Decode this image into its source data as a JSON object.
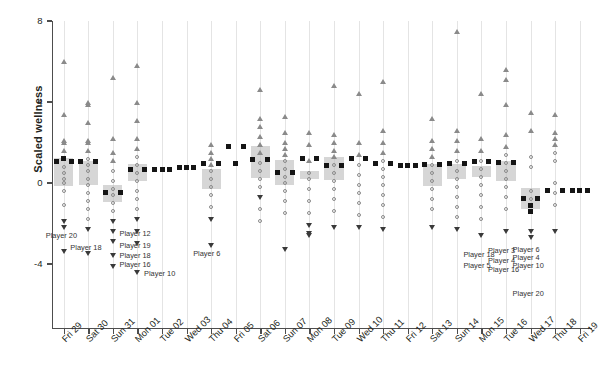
{
  "chart_data": {
    "type": "bar",
    "title": "",
    "xlabel": "",
    "ylabel": "Scaled wellness",
    "ylim": [
      -6.2,
      8
    ],
    "yticks": [
      8,
      4,
      0,
      -4
    ],
    "ytick_labels": [
      "8",
      "4",
      "0",
      "-4"
    ],
    "grid": "vertical-only",
    "legend": "none",
    "categories": [
      "Fri 29",
      "Sat 30",
      "Sun 31",
      "Mon 01",
      "Tue 02",
      "Wed 03",
      "Thu 04",
      "Fri 05",
      "Sat 06",
      "Sun 07",
      "Mon 08",
      "Tue 09",
      "Wed 10",
      "Thu 11",
      "Fri 12",
      "Sat 13",
      "Sun 14",
      "Mon 15",
      "Tue 16",
      "Wed 17",
      "Thu 18",
      "Fri 19"
    ],
    "series": [
      {
        "name": "Team mean scaled wellness",
        "marker": "filled-square",
        "values": [
          1.05,
          1.05,
          -0.45,
          0.65,
          0.65,
          0.75,
          0.95,
          1.8,
          1.15,
          0.5,
          1.2,
          0.85,
          1.2,
          0.95,
          0.85,
          0.9,
          0.95,
          1.05,
          1.0,
          -0.75,
          -0.35,
          -0.35
        ]
      }
    ],
    "boxes": [
      {
        "category": "Fri 29",
        "low": -0.15,
        "high": 1.25
      },
      {
        "category": "Sat 30",
        "low": -0.1,
        "high": 1.1
      },
      {
        "category": "Sun 31",
        "low": -0.95,
        "high": -0.1
      },
      {
        "category": "Mon 01",
        "low": 0.1,
        "high": 0.95
      },
      {
        "category": "Tue 02",
        "low": 0.0,
        "high": 0.0
      },
      {
        "category": "Wed 03",
        "low": 0.0,
        "high": 0.0
      },
      {
        "category": "Thu 04",
        "low": -0.3,
        "high": 0.7
      },
      {
        "category": "Fri 05",
        "low": 0.0,
        "high": 0.0
      },
      {
        "category": "Sat 06",
        "low": 0.25,
        "high": 1.85
      },
      {
        "category": "Sun 07",
        "low": -0.1,
        "high": 1.15
      },
      {
        "category": "Mon 08",
        "low": 0.2,
        "high": 0.6
      },
      {
        "category": "Tue 09",
        "low": 0.15,
        "high": 1.3
      },
      {
        "category": "Wed 10",
        "low": 0.0,
        "high": 0.0
      },
      {
        "category": "Thu 11",
        "low": 0.0,
        "high": 0.0
      },
      {
        "category": "Fri 12",
        "low": 0.0,
        "high": 0.0
      },
      {
        "category": "Sat 13",
        "low": -0.15,
        "high": 0.95
      },
      {
        "category": "Sun 14",
        "low": 0.2,
        "high": 0.95
      },
      {
        "category": "Mon 15",
        "low": 0.3,
        "high": 0.85
      },
      {
        "category": "Tue 16",
        "low": 0.1,
        "high": 1.1
      },
      {
        "category": "Wed 17",
        "low": -1.3,
        "high": -0.25
      },
      {
        "category": "Thu 18",
        "low": 0.0,
        "high": 0.0
      },
      {
        "category": "Fri 19",
        "low": 0.0,
        "high": 0.0
      }
    ],
    "points": [
      {
        "category": "Fri 29",
        "values": [
          6.0,
          3.4,
          2.1,
          2.0,
          1.6,
          1.2,
          0.8,
          0.5,
          0.2,
          0.0,
          -0.4,
          -1.1,
          -1.9,
          -2.2,
          -3.4
        ],
        "markers": [
          "up",
          "up",
          "up",
          "up",
          "up",
          "sq",
          "circle",
          "circle",
          "circle",
          "circle",
          "circle",
          "circle",
          "down",
          "down",
          "down"
        ]
      },
      {
        "category": "Sat 30",
        "values": [
          4.0,
          3.9,
          3.0,
          2.1,
          2.0,
          1.6,
          1.2,
          0.9,
          0.6,
          0.2,
          -0.1,
          -0.5,
          -0.9,
          -1.3,
          -1.8,
          -2.3,
          -3.5
        ],
        "markers": [
          "up",
          "up",
          "up",
          "up",
          "up",
          "up",
          "circle",
          "circle",
          "circle",
          "circle",
          "circle",
          "circle",
          "circle",
          "circle",
          "circle",
          "down",
          "down"
        ]
      },
      {
        "category": "Sun 31",
        "values": [
          5.2,
          2.2,
          1.5,
          1.1,
          0.6,
          0.1,
          -0.3,
          -0.6,
          -1.0,
          -1.4,
          -1.9,
          -2.4,
          -2.9,
          -3.6,
          -4.1
        ],
        "markers": [
          "up",
          "up",
          "up",
          "up",
          "circle",
          "circle",
          "circle",
          "circle",
          "circle",
          "circle",
          "down",
          "down",
          "down",
          "down",
          "down"
        ]
      },
      {
        "category": "Mon 01",
        "values": [
          5.8,
          4.0,
          3.1,
          2.2,
          1.7,
          1.3,
          0.9,
          0.5,
          0.1,
          -0.4,
          -0.8,
          -1.3,
          -1.8,
          -2.4,
          -3.0,
          -4.4
        ],
        "markers": [
          "up",
          "up",
          "up",
          "up",
          "up",
          "circle",
          "circle",
          "circle",
          "circle",
          "circle",
          "circle",
          "circle",
          "down",
          "down",
          "down",
          "down"
        ]
      },
      {
        "category": "Tue 02",
        "values": [
          0.65
        ],
        "markers": [
          "sq"
        ]
      },
      {
        "category": "Wed 03",
        "values": [
          0.75
        ],
        "markers": [
          "sq"
        ]
      },
      {
        "category": "Thu 04",
        "values": [
          1.9,
          1.5,
          1.2,
          0.9,
          0.6,
          0.2,
          -0.2,
          -0.6,
          -1.2,
          -1.8,
          -3.1
        ],
        "markers": [
          "up",
          "up",
          "up",
          "up",
          "circle",
          "circle",
          "circle",
          "circle",
          "circle",
          "down",
          "down"
        ]
      },
      {
        "category": "Fri 05",
        "values": [
          0.95
        ],
        "markers": [
          "sq"
        ]
      },
      {
        "category": "Sat 06",
        "values": [
          4.6,
          3.2,
          2.8,
          2.3,
          1.9,
          1.5,
          1.0,
          0.6,
          0.2,
          -0.2,
          -0.7,
          -1.3,
          -1.9
        ],
        "markers": [
          "up",
          "up",
          "up",
          "up",
          "up",
          "up",
          "circle",
          "circle",
          "circle",
          "circle",
          "down",
          "circle",
          "circle"
        ]
      },
      {
        "category": "Sun 07",
        "values": [
          3.3,
          2.5,
          2.0,
          1.7,
          1.4,
          1.1,
          0.7,
          0.3,
          0.0,
          -0.4,
          -0.9,
          -1.5,
          -3.3
        ],
        "markers": [
          "up",
          "up",
          "up",
          "up",
          "up",
          "circle",
          "circle",
          "circle",
          "circle",
          "circle",
          "circle",
          "circle",
          "down"
        ]
      },
      {
        "category": "Mon 08",
        "values": [
          2.5,
          1.9,
          1.1,
          0.5,
          0.2,
          -0.3,
          -0.9,
          -1.5,
          -2.1,
          -2.5,
          -2.6
        ],
        "markers": [
          "up",
          "up",
          "up",
          "circle",
          "circle",
          "circle",
          "circle",
          "circle",
          "down",
          "down",
          "down"
        ]
      },
      {
        "category": "Tue 09",
        "values": [
          4.8,
          2.4,
          2.0,
          1.6,
          1.3,
          0.9,
          0.5,
          0.1,
          -0.3,
          -0.8,
          -1.4,
          -2.2
        ],
        "markers": [
          "up",
          "up",
          "up",
          "up",
          "up",
          "circle",
          "circle",
          "circle",
          "circle",
          "circle",
          "circle",
          "down"
        ]
      },
      {
        "category": "Wed 10",
        "values": [
          4.4,
          2.0,
          1.4,
          0.9,
          0.4,
          -0.1,
          -0.5,
          -1.0,
          -1.6,
          -2.2
        ],
        "markers": [
          "up",
          "up",
          "up",
          "circle",
          "circle",
          "circle",
          "circle",
          "circle",
          "circle",
          "down"
        ]
      },
      {
        "category": "Thu 11",
        "values": [
          5.0,
          2.6,
          2.0,
          1.5,
          1.1,
          0.7,
          0.3,
          -0.1,
          -0.6,
          -1.1,
          -1.7,
          -2.3
        ],
        "markers": [
          "up",
          "up",
          "up",
          "up",
          "circle",
          "circle",
          "circle",
          "circle",
          "circle",
          "circle",
          "circle",
          "down"
        ]
      },
      {
        "category": "Fri 12",
        "values": [
          0.85
        ],
        "markers": [
          "sq"
        ]
      },
      {
        "category": "Sat 13",
        "values": [
          3.2,
          2.1,
          1.7,
          1.3,
          0.9,
          0.5,
          0.1,
          -0.3,
          -0.8,
          -1.3,
          -2.2
        ],
        "markers": [
          "up",
          "up",
          "up",
          "up",
          "circle",
          "circle",
          "circle",
          "circle",
          "circle",
          "circle",
          "down"
        ]
      },
      {
        "category": "Sun 14",
        "values": [
          7.5,
          2.6,
          2.1,
          1.6,
          1.1,
          0.6,
          0.2,
          -0.2,
          -0.7,
          -1.2,
          -1.7,
          -2.3
        ],
        "markers": [
          "up",
          "up",
          "up",
          "up",
          "circle",
          "circle",
          "circle",
          "circle",
          "circle",
          "circle",
          "circle",
          "down"
        ]
      },
      {
        "category": "Mon 15",
        "values": [
          4.4,
          2.2,
          1.6,
          1.1,
          0.7,
          0.3,
          -0.1,
          -0.6,
          -1.2,
          -1.8,
          -2.6
        ],
        "markers": [
          "up",
          "up",
          "up",
          "circle",
          "circle",
          "circle",
          "circle",
          "circle",
          "circle",
          "circle",
          "down"
        ]
      },
      {
        "category": "Tue 16",
        "values": [
          5.6,
          5.1,
          3.9,
          2.4,
          1.8,
          1.4,
          1.0,
          0.6,
          0.2,
          -0.2,
          -0.7,
          -1.3,
          -2.4
        ],
        "markers": [
          "up",
          "up",
          "up",
          "up",
          "up",
          "circle",
          "circle",
          "circle",
          "circle",
          "circle",
          "circle",
          "circle",
          "down"
        ]
      },
      {
        "category": "Wed 17",
        "values": [
          3.5,
          2.6,
          1.3,
          0.8,
          -0.4,
          -0.8,
          -1.1,
          -1.4,
          -2.4,
          -2.7
        ],
        "markers": [
          "up",
          "up",
          "circle",
          "circle",
          "circle",
          "circle",
          "sq",
          "sq",
          "down",
          "down"
        ]
      },
      {
        "category": "Thu 18",
        "values": [
          3.4,
          2.5,
          2.2,
          1.9,
          1.5,
          1.1,
          0.0,
          -0.5,
          -1.1,
          -2.4
        ],
        "markers": [
          "up",
          "up",
          "up",
          "up",
          "circle",
          "circle",
          "circle",
          "circle",
          "circle",
          "down"
        ]
      },
      {
        "category": "Fri 19",
        "values": [
          -0.35
        ],
        "markers": [
          "sq"
        ]
      }
    ],
    "annotations": [
      {
        "label": "Player 20",
        "category": "Fri 29",
        "y": -2.55
      },
      {
        "label": "Player 18",
        "category": "Sat 30",
        "y": -3.15
      },
      {
        "label": "Player 12",
        "category": "Mon 01",
        "y": -2.45
      },
      {
        "label": "Player 19",
        "category": "Mon 01",
        "y": -3.05
      },
      {
        "label": "Player 18",
        "category": "Mon 01",
        "y": -3.55
      },
      {
        "label": "Player 16",
        "category": "Mon 01",
        "y": -4.0
      },
      {
        "label": "Player 10",
        "category": "Tue 02",
        "y": -4.45
      },
      {
        "label": "Player 6",
        "category": "Thu 04",
        "y": -3.45
      },
      {
        "label": "Player 18",
        "category": "Mon 15",
        "y": -3.5
      },
      {
        "label": "Player 5",
        "category": "Mon 15",
        "y": -4.05
      },
      {
        "label": "Player 3",
        "category": "Tue 16",
        "y": -3.3
      },
      {
        "label": "Player 4",
        "category": "Tue 16",
        "y": -3.8
      },
      {
        "label": "Player 16",
        "category": "Tue 16",
        "y": -4.25
      },
      {
        "label": "Player 6",
        "category": "Wed 17",
        "y": -3.25
      },
      {
        "label": "Player 4",
        "category": "Wed 17",
        "y": -3.65
      },
      {
        "label": "Player 10",
        "category": "Wed 17",
        "y": -4.05
      },
      {
        "label": "Player 20",
        "category": "Wed 17",
        "y": -5.45
      }
    ]
  },
  "style": {
    "box_fill": "#bdbdbd",
    "mean_marker_color": "#151515",
    "point_outline": "#8a8a8a",
    "axis_color": "#4d4d4d",
    "gridline_color": "#e4e4e4",
    "background": "#ffffff"
  }
}
